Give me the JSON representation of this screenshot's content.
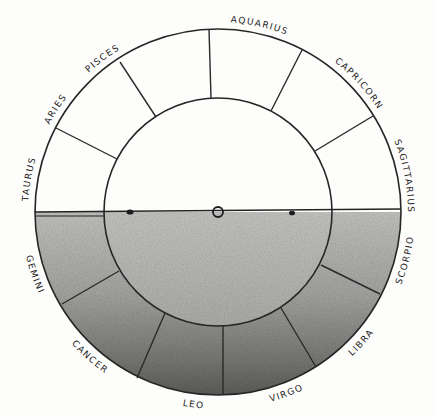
{
  "diagram": {
    "title": "",
    "colors": {
      "line": "#262626",
      "paper": "#fdfdfc",
      "shade_light": "#c6c6c4",
      "shade_dark": "#666664"
    },
    "geometry": {
      "center": [
        218,
        212
      ],
      "outer_radius": 183,
      "inner_radius": 114
    },
    "signs_above_horizon": [
      {
        "label": "Taurus",
        "offset": "5.5%"
      },
      {
        "label": "Aries",
        "offset": "18%"
      },
      {
        "label": "Pisces",
        "offset": "29.5%"
      },
      {
        "label": "Aquarius",
        "offset": "57%"
      },
      {
        "label": "Capricorn",
        "offset": "76.5%"
      },
      {
        "label": "Sagittarius",
        "offset": "94%"
      }
    ],
    "signs_below_horizon": [
      {
        "label": "Gemini",
        "offset": "10.5%"
      },
      {
        "label": "Cancer",
        "offset": "27%"
      },
      {
        "label": "Leo",
        "offset": "46%"
      },
      {
        "label": "Virgo",
        "offset": "61.5%"
      },
      {
        "label": "Libra",
        "offset": "76.5%"
      },
      {
        "label": "Scorpio",
        "offset": "92%"
      }
    ],
    "horizon_markers": [
      {
        "type": "filled-dot",
        "x": 130,
        "y": 212
      },
      {
        "type": "open-circle",
        "x": 218,
        "y": 212
      },
      {
        "type": "filled-dot",
        "x": 292,
        "y": 213
      }
    ]
  }
}
